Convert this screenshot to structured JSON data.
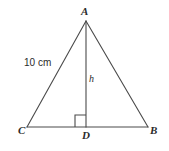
{
  "figure": {
    "type": "geometry-diagram",
    "shape": "triangle-with-altitude",
    "background_color": "#ffffff",
    "stroke_color": "#4a4a4a",
    "text_color": "#2b2b2b",
    "labels": {
      "apex": "A",
      "base_right": "B",
      "base_left": "C",
      "foot_of_altitude": "D",
      "side_length": "10 cm",
      "height": "h"
    },
    "geometry": {
      "points": {
        "A": {
          "x": 86,
          "y": 21
        },
        "B": {
          "x": 148,
          "y": 127
        },
        "C": {
          "x": 27,
          "y": 127
        },
        "D": {
          "x": 86,
          "y": 127
        }
      },
      "segments": [
        {
          "name": "CA",
          "from": "C",
          "to": "A"
        },
        {
          "name": "AB",
          "from": "A",
          "to": "B"
        },
        {
          "name": "CB",
          "from": "C",
          "to": "B"
        },
        {
          "name": "AD",
          "from": "A",
          "to": "D"
        }
      ],
      "right_angle_marker": {
        "at": "D",
        "size": 11,
        "orientation": "upper-left"
      }
    }
  }
}
